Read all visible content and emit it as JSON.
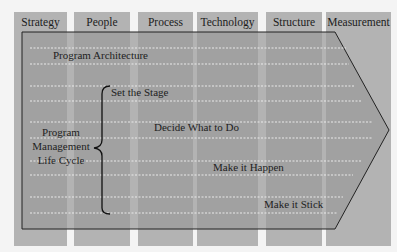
{
  "columns": [
    {
      "label": "Strategy",
      "x": 14,
      "w": 53
    },
    {
      "label": "People",
      "x": 74,
      "w": 56
    },
    {
      "label": "Process",
      "x": 138,
      "w": 55
    },
    {
      "label": "Technology",
      "x": 197,
      "w": 61
    },
    {
      "label": "Structure",
      "x": 266,
      "w": 56
    },
    {
      "label": "Measurement",
      "x": 326,
      "w": 65
    }
  ],
  "arrow": {
    "fill": "#9e9e9e",
    "stroke": "#222222"
  },
  "labels": {
    "program_architecture": "Program Architecture",
    "lifecycle_line1": "Program",
    "lifecycle_line2": "Management",
    "lifecycle_line3": "Life Cycle",
    "phase_1": "Set the Stage",
    "phase_2": "Decide What to Do",
    "phase_3": "Make it Happen",
    "phase_4": "Make it Stick"
  },
  "colors": {
    "column_bg": "#b3b3b3",
    "page_bg": "#f4f4f4",
    "dashed_line": "#eeeeee"
  }
}
